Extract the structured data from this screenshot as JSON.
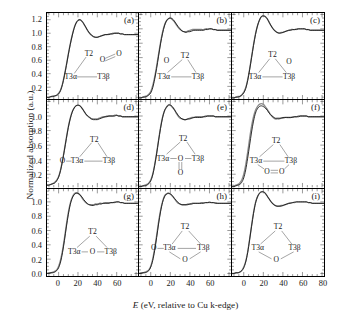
{
  "axes": {
    "ylabel": "Normalized absorption (a.u.)",
    "xlabel_italic": "E",
    "xlabel_rest": " (eV, relative to Cu k-edge)",
    "xticks": [
      0,
      20,
      40,
      60
    ],
    "xticks_last": [
      0,
      20,
      40,
      60,
      80
    ],
    "yticks_top": [
      "1.2",
      "1.0",
      "0.8",
      "0.6",
      "0.4",
      "0.2"
    ],
    "yticks_mid": [
      "1.0",
      "0.8",
      "0.6",
      "0.4",
      "0.2"
    ],
    "yticks_bot": [
      "1.0",
      "0.8",
      "0.6",
      "0.4",
      "0.2",
      "0.0"
    ],
    "xlim": [
      -12,
      82
    ],
    "ylim_top": [
      0.02,
      1.3
    ],
    "ylim_mid": [
      0.02,
      1.22
    ],
    "ylim_bot": [
      -0.04,
      1.18
    ]
  },
  "colors": {
    "curve_primary": "#1a1a1a",
    "curve_secondary": "#8c8c8c",
    "frame": "#000000",
    "diagram": "#333333"
  },
  "labels": {
    "T2": "T2",
    "T3a": "T3α",
    "T3b": "T3β",
    "O": "O",
    "OO": "O=O"
  },
  "panels": [
    {
      "id": "a",
      "label": "(a)",
      "caption": "T2 with pendant O=O peroxide, T3α—T3β bonded"
    },
    {
      "id": "b",
      "label": "(b)",
      "caption": "O adjacent to T2 on left side of triangle"
    },
    {
      "id": "c",
      "label": "(c)",
      "caption": "O adjacent to T2 on right side of triangle"
    },
    {
      "id": "d",
      "label": "(d)",
      "caption": "O bonded to T3α externally"
    },
    {
      "id": "e",
      "label": "(e)",
      "caption": "T3α—O—T3β bridge with O double-bonded below"
    },
    {
      "id": "f",
      "label": "(f)",
      "caption": "O=O bridging T3α and T3β below the bond"
    },
    {
      "id": "g",
      "label": "(g)",
      "caption": "T3α—O—T3β single bridging O"
    },
    {
      "id": "h",
      "label": "(h)",
      "caption": "External O on T3α plus bridging O below"
    },
    {
      "id": "i",
      "label": "(i)",
      "caption": "O bridging T3α and T3β, no direct T3 bond"
    }
  ],
  "chart_data": {
    "type": "line",
    "title": "",
    "xlabel": "E (eV, relative to Cu k-edge)",
    "ylabel": "Normalized absorption (a.u.)",
    "xlim": [
      -12,
      82
    ],
    "grid": false,
    "legend": "none",
    "n_panels": 9,
    "series_per_panel": 2,
    "series_names": [
      "calculated",
      "experimental"
    ],
    "x": [
      -12,
      -10,
      -8,
      -6,
      -4,
      -2,
      0,
      2,
      4,
      6,
      8,
      10,
      12,
      14,
      16,
      18,
      20,
      22,
      24,
      26,
      28,
      30,
      32,
      34,
      36,
      38,
      40,
      42,
      44,
      46,
      48,
      50,
      52,
      54,
      56,
      58,
      60,
      62,
      64,
      66,
      68,
      70,
      72,
      74,
      76,
      78,
      80,
      82
    ],
    "panel_series": {
      "a": {
        "ylim": [
          0.02,
          1.3
        ],
        "primary": [
          0.05,
          0.05,
          0.06,
          0.06,
          0.07,
          0.08,
          0.1,
          0.15,
          0.24,
          0.37,
          0.52,
          0.68,
          0.83,
          0.96,
          1.07,
          1.15,
          1.19,
          1.2,
          1.18,
          1.14,
          1.09,
          1.04,
          1.0,
          0.97,
          0.95,
          0.94,
          0.94,
          0.95,
          0.96,
          0.97,
          0.98,
          0.98,
          0.98,
          0.99,
          0.99,
          1.0,
          1.0,
          1.0,
          0.99,
          0.99,
          0.98,
          0.98,
          0.98,
          0.98,
          0.98,
          0.98,
          0.98,
          0.98
        ],
        "secondary": [
          0.05,
          0.05,
          0.06,
          0.07,
          0.07,
          0.08,
          0.11,
          0.16,
          0.25,
          0.38,
          0.53,
          0.69,
          0.84,
          0.97,
          1.08,
          1.15,
          1.19,
          1.2,
          1.18,
          1.14,
          1.09,
          1.04,
          1.0,
          0.97,
          0.95,
          0.94,
          0.94,
          0.95,
          0.96,
          0.97,
          0.98,
          0.98,
          0.99,
          0.99,
          1.0,
          1.0,
          1.0,
          1.0,
          0.99,
          0.99,
          0.98,
          0.98,
          0.98,
          0.98,
          0.98,
          0.98,
          0.98,
          0.98
        ]
      },
      "b": {
        "ylim": [
          0.02,
          1.22
        ],
        "primary": [
          0.04,
          0.04,
          0.05,
          0.05,
          0.06,
          0.08,
          0.11,
          0.18,
          0.3,
          0.45,
          0.62,
          0.79,
          0.93,
          1.04,
          1.11,
          1.14,
          1.15,
          1.14,
          1.11,
          1.07,
          1.03,
          1.0,
          0.97,
          0.96,
          0.95,
          0.96,
          0.96,
          0.97,
          0.98,
          0.98,
          0.98,
          0.98,
          0.98,
          0.98,
          0.99,
          0.99,
          1.0,
          1.0,
          0.99,
          0.99,
          0.98,
          0.98,
          0.98,
          0.98,
          0.98,
          0.98,
          0.98,
          0.98
        ],
        "secondary": [
          0.04,
          0.04,
          0.05,
          0.06,
          0.07,
          0.09,
          0.13,
          0.21,
          0.33,
          0.48,
          0.65,
          0.81,
          0.95,
          1.05,
          1.11,
          1.14,
          1.15,
          1.13,
          1.1,
          1.06,
          1.02,
          0.99,
          0.97,
          0.96,
          0.96,
          0.97,
          0.98,
          0.99,
          0.99,
          0.99,
          0.99,
          0.99,
          0.99,
          0.99,
          1.0,
          1.0,
          1.0,
          1.0,
          0.99,
          0.99,
          0.98,
          0.98,
          0.98,
          0.98,
          0.98,
          0.98,
          0.98,
          0.98
        ]
      },
      "c": {
        "ylim": [
          0.02,
          1.22
        ],
        "primary": [
          0.04,
          0.04,
          0.05,
          0.05,
          0.06,
          0.08,
          0.11,
          0.17,
          0.28,
          0.43,
          0.6,
          0.77,
          0.92,
          1.04,
          1.12,
          1.17,
          1.18,
          1.17,
          1.14,
          1.09,
          1.04,
          1.0,
          0.97,
          0.95,
          0.94,
          0.94,
          0.95,
          0.96,
          0.97,
          0.98,
          0.98,
          0.99,
          0.99,
          0.99,
          1.0,
          1.0,
          1.0,
          1.0,
          0.99,
          0.99,
          0.98,
          0.98,
          0.98,
          0.98,
          0.98,
          0.98,
          0.98,
          0.98
        ],
        "secondary": [
          0.04,
          0.04,
          0.05,
          0.06,
          0.06,
          0.08,
          0.12,
          0.18,
          0.29,
          0.44,
          0.61,
          0.78,
          0.93,
          1.04,
          1.12,
          1.17,
          1.18,
          1.17,
          1.14,
          1.09,
          1.04,
          1.0,
          0.97,
          0.95,
          0.94,
          0.95,
          0.95,
          0.96,
          0.97,
          0.98,
          0.99,
          0.99,
          0.99,
          1.0,
          1.0,
          1.0,
          1.0,
          1.0,
          0.99,
          0.99,
          0.98,
          0.98,
          0.98,
          0.98,
          0.98,
          0.98,
          0.98,
          0.98
        ]
      },
      "d": {
        "ylim": [
          0.02,
          1.22
        ],
        "primary": [
          0.05,
          0.05,
          0.06,
          0.07,
          0.08,
          0.11,
          0.16,
          0.25,
          0.38,
          0.53,
          0.69,
          0.84,
          0.96,
          1.05,
          1.11,
          1.14,
          1.15,
          1.14,
          1.11,
          1.07,
          1.03,
          1.0,
          0.98,
          0.96,
          0.95,
          0.95,
          0.95,
          0.96,
          0.97,
          0.98,
          0.99,
          0.99,
          1.0,
          1.0,
          1.0,
          1.0,
          1.01,
          1.0,
          1.0,
          0.99,
          0.99,
          0.99,
          0.99,
          0.99,
          0.99,
          0.99,
          0.99,
          0.99
        ],
        "secondary": [
          0.05,
          0.05,
          0.06,
          0.07,
          0.09,
          0.12,
          0.17,
          0.26,
          0.39,
          0.54,
          0.7,
          0.85,
          0.97,
          1.06,
          1.11,
          1.14,
          1.15,
          1.14,
          1.11,
          1.07,
          1.03,
          1.0,
          0.98,
          0.96,
          0.96,
          0.96,
          0.96,
          0.97,
          0.98,
          0.99,
          0.99,
          1.0,
          1.0,
          1.0,
          1.0,
          1.01,
          1.01,
          1.0,
          1.0,
          0.99,
          0.99,
          0.99,
          0.99,
          0.99,
          0.99,
          0.99,
          0.99,
          0.99
        ]
      },
      "e": {
        "ylim": [
          0.02,
          1.22
        ],
        "primary": [
          0.03,
          0.03,
          0.04,
          0.04,
          0.05,
          0.07,
          0.11,
          0.19,
          0.32,
          0.48,
          0.66,
          0.83,
          0.97,
          1.07,
          1.12,
          1.15,
          1.15,
          1.13,
          1.09,
          1.05,
          1.01,
          0.98,
          0.96,
          0.95,
          0.95,
          0.96,
          0.96,
          0.97,
          0.98,
          0.98,
          0.98,
          0.98,
          0.98,
          0.99,
          0.99,
          1.0,
          1.0,
          1.0,
          1.0,
          0.99,
          0.99,
          0.99,
          0.99,
          0.99,
          0.99,
          0.99,
          0.99,
          0.99
        ],
        "secondary": [
          0.03,
          0.03,
          0.04,
          0.05,
          0.06,
          0.08,
          0.12,
          0.2,
          0.33,
          0.49,
          0.67,
          0.84,
          0.98,
          1.07,
          1.12,
          1.15,
          1.15,
          1.12,
          1.09,
          1.04,
          1.0,
          0.97,
          0.96,
          0.95,
          0.95,
          0.96,
          0.97,
          0.98,
          0.98,
          0.99,
          0.99,
          0.99,
          0.99,
          0.99,
          1.0,
          1.0,
          1.0,
          1.0,
          1.0,
          0.99,
          0.99,
          0.99,
          0.99,
          0.99,
          0.99,
          0.99,
          0.99,
          0.99
        ]
      },
      "f": {
        "ylim": [
          0.02,
          1.22
        ],
        "primary": [
          0.03,
          0.03,
          0.04,
          0.05,
          0.06,
          0.09,
          0.15,
          0.26,
          0.42,
          0.6,
          0.78,
          0.93,
          1.04,
          1.1,
          1.13,
          1.14,
          1.13,
          1.11,
          1.08,
          1.04,
          1.01,
          0.99,
          0.97,
          0.97,
          0.97,
          0.97,
          0.98,
          0.98,
          0.98,
          0.98,
          0.98,
          0.98,
          0.99,
          0.99,
          0.99,
          1.0,
          1.0,
          1.0,
          1.0,
          0.99,
          0.99,
          0.99,
          0.99,
          0.99,
          0.99,
          0.99,
          0.99,
          0.99
        ],
        "secondary": [
          0.03,
          0.04,
          0.05,
          0.06,
          0.08,
          0.12,
          0.2,
          0.33,
          0.5,
          0.69,
          0.86,
          0.99,
          1.08,
          1.13,
          1.16,
          1.17,
          1.16,
          1.13,
          1.09,
          1.05,
          1.01,
          0.98,
          0.96,
          0.96,
          0.96,
          0.97,
          0.97,
          0.98,
          0.98,
          0.98,
          0.98,
          0.99,
          0.99,
          0.99,
          1.0,
          1.0,
          1.0,
          1.0,
          1.0,
          0.99,
          0.99,
          0.99,
          0.99,
          0.99,
          0.99,
          0.99,
          0.99,
          0.99
        ]
      },
      "g": {
        "ylim": [
          -0.04,
          1.18
        ],
        "primary": [
          0.0,
          0.0,
          0.01,
          0.01,
          0.02,
          0.04,
          0.08,
          0.16,
          0.29,
          0.46,
          0.65,
          0.82,
          0.96,
          1.05,
          1.1,
          1.12,
          1.12,
          1.1,
          1.07,
          1.03,
          1.0,
          0.97,
          0.96,
          0.95,
          0.95,
          0.96,
          0.96,
          0.97,
          0.97,
          0.98,
          0.98,
          0.98,
          0.98,
          0.99,
          0.99,
          0.99,
          1.0,
          1.0,
          0.99,
          0.99,
          0.98,
          0.98,
          0.98,
          0.98,
          0.98,
          0.98,
          0.98,
          0.98
        ],
        "secondary": [
          0.0,
          0.01,
          0.01,
          0.02,
          0.03,
          0.05,
          0.1,
          0.19,
          0.32,
          0.49,
          0.68,
          0.85,
          0.98,
          1.06,
          1.11,
          1.13,
          1.12,
          1.1,
          1.06,
          1.02,
          0.99,
          0.97,
          0.96,
          0.96,
          0.96,
          0.97,
          0.97,
          0.98,
          0.98,
          0.98,
          0.99,
          0.99,
          0.99,
          0.99,
          0.99,
          1.0,
          1.0,
          1.0,
          0.99,
          0.99,
          0.98,
          0.98,
          0.98,
          0.98,
          0.98,
          0.98,
          0.98,
          0.98
        ]
      },
      "h": {
        "ylim": [
          -0.04,
          1.18
        ],
        "primary": [
          0.0,
          0.0,
          0.01,
          0.01,
          0.02,
          0.04,
          0.09,
          0.18,
          0.32,
          0.5,
          0.69,
          0.86,
          0.99,
          1.07,
          1.11,
          1.12,
          1.11,
          1.09,
          1.05,
          1.02,
          0.99,
          0.97,
          0.96,
          0.96,
          0.96,
          0.96,
          0.97,
          0.97,
          0.98,
          0.98,
          0.98,
          0.98,
          0.98,
          0.98,
          0.99,
          0.99,
          0.99,
          0.99,
          0.99,
          0.98,
          0.98,
          0.98,
          0.98,
          0.98,
          0.98,
          0.98,
          0.98,
          0.98
        ],
        "secondary": [
          0.0,
          0.01,
          0.01,
          0.02,
          0.03,
          0.05,
          0.1,
          0.2,
          0.35,
          0.53,
          0.72,
          0.88,
          1.0,
          1.08,
          1.11,
          1.12,
          1.11,
          1.08,
          1.05,
          1.01,
          0.98,
          0.97,
          0.96,
          0.96,
          0.96,
          0.97,
          0.97,
          0.98,
          0.98,
          0.98,
          0.98,
          0.98,
          0.99,
          0.99,
          0.99,
          0.99,
          1.0,
          0.99,
          0.99,
          0.99,
          0.98,
          0.98,
          0.98,
          0.98,
          0.98,
          0.98,
          0.98,
          0.98
        ]
      },
      "i": {
        "ylim": [
          -0.04,
          1.18
        ],
        "primary": [
          0.0,
          0.0,
          0.01,
          0.01,
          0.02,
          0.04,
          0.08,
          0.16,
          0.29,
          0.47,
          0.66,
          0.84,
          0.98,
          1.07,
          1.12,
          1.14,
          1.14,
          1.12,
          1.08,
          1.04,
          1.0,
          0.97,
          0.95,
          0.94,
          0.94,
          0.94,
          0.95,
          0.96,
          0.97,
          0.98,
          0.98,
          0.99,
          0.99,
          1.0,
          1.0,
          1.0,
          1.0,
          1.0,
          1.0,
          0.99,
          0.99,
          0.98,
          0.98,
          0.98,
          0.98,
          0.98,
          0.98,
          0.98
        ],
        "secondary": [
          0.0,
          0.0,
          0.01,
          0.01,
          0.02,
          0.04,
          0.09,
          0.17,
          0.3,
          0.48,
          0.67,
          0.85,
          0.99,
          1.07,
          1.12,
          1.14,
          1.14,
          1.12,
          1.08,
          1.04,
          1.0,
          0.97,
          0.95,
          0.94,
          0.94,
          0.95,
          0.95,
          0.96,
          0.97,
          0.98,
          0.99,
          0.99,
          1.0,
          1.0,
          1.0,
          1.0,
          1.0,
          1.0,
          1.0,
          0.99,
          0.99,
          0.98,
          0.98,
          0.98,
          0.98,
          0.98,
          0.98,
          0.98
        ]
      }
    }
  }
}
